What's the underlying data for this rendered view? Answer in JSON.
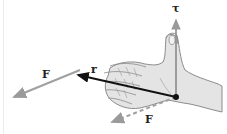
{
  "diagram": {
    "labels": {
      "torque": "τ",
      "position": "r",
      "force_applied": "F",
      "force_translated": "F"
    },
    "colors": {
      "torque_vector": "#8a8a8a",
      "position_vector": "#111111",
      "force_vector": "#a0a0a0",
      "hand_fill": "#e4e4e4",
      "hand_outline": "#8c8c8c",
      "pivot": "#111111"
    }
  }
}
